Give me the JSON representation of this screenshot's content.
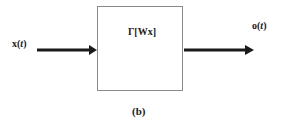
{
  "diagram": {
    "input_label": {
      "prefix": "x(",
      "var": "t",
      "suffix": ")"
    },
    "output_label": {
      "prefix": "o(",
      "var": "t",
      "suffix": ")"
    },
    "block_label": "Γ[Wx]",
    "caption": "(b)",
    "colors": {
      "stroke": "#1a1a1a",
      "box_border": "#8a8a8a"
    }
  }
}
